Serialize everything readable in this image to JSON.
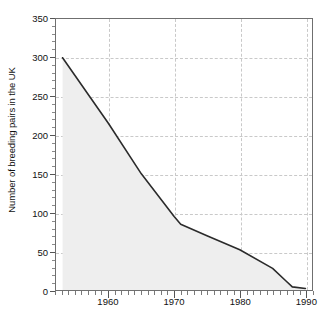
{
  "chart_data": {
    "type": "area",
    "title": "",
    "subtitle": "",
    "xlabel": "",
    "ylabel": "Number of breeding pairs in the UK",
    "xlim": [
      1952,
      1991
    ],
    "ylim": [
      0,
      350
    ],
    "grid": true,
    "legend_position": "none",
    "y_ticks": [
      0,
      50,
      100,
      150,
      200,
      250,
      300,
      350
    ],
    "y_tick_labels": [
      "0",
      "50",
      "100",
      "150",
      "200",
      "250",
      "300",
      "350"
    ],
    "y_minor_tick_step": 10,
    "x_ticks": [
      1960,
      1970,
      1980,
      1990
    ],
    "x_tick_labels": [
      "1960",
      "1970",
      "1980",
      "1990"
    ],
    "x_minor_tick_step": 1,
    "x_gridlines": [
      1960,
      1970,
      1980,
      1990
    ],
    "series": [
      {
        "name": "Breeding pairs in the UK",
        "line_color": "#2b2b2b",
        "fill_color": "#eeeeee",
        "x": [
          1953,
          1960,
          1965,
          1970,
          1971,
          1975,
          1980,
          1985,
          1987,
          1988,
          1990
        ],
        "values": [
          300,
          215,
          150,
          95,
          85,
          70,
          52,
          28,
          12,
          4,
          2
        ]
      }
    ],
    "annotations": []
  },
  "axes": {
    "frame_color": "#6f6f6f",
    "gridline_color": "#c9c9c9",
    "tick_color": "#555555",
    "label_color": "#111111"
  }
}
